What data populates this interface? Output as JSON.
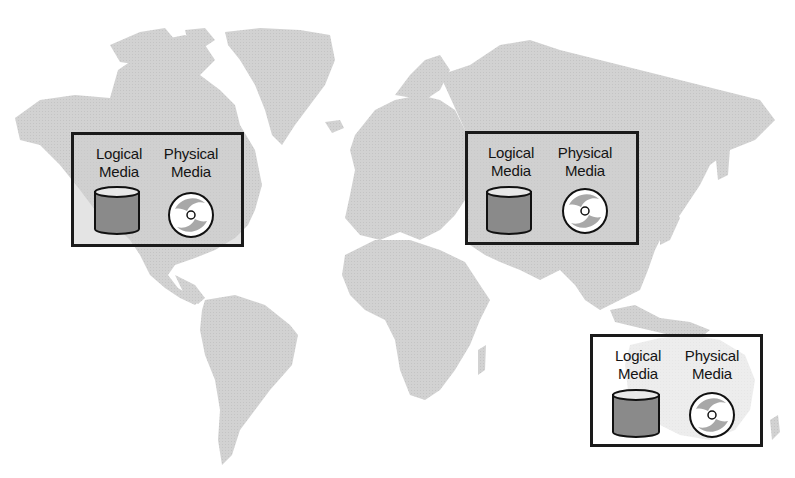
{
  "diagram": {
    "background": "world-map",
    "colors": {
      "land": "#cfcfcf",
      "ocean": "#ffffff",
      "box_border": "#1a1a1a",
      "cylinder_fill": "#8a8a8a",
      "disc_fill": "#ffffff",
      "disc_swirl": "#a8a8a8"
    },
    "sites": [
      {
        "region": "North America",
        "logical": {
          "line1": "Logical",
          "line2": "Media",
          "icon": "cylinder-icon"
        },
        "physical": {
          "line1": "Physical",
          "line2": "Media",
          "icon": "disc-icon"
        }
      },
      {
        "region": "Asia",
        "logical": {
          "line1": "Logical",
          "line2": "Media",
          "icon": "cylinder-icon"
        },
        "physical": {
          "line1": "Physical",
          "line2": "Media",
          "icon": "disc-icon"
        }
      },
      {
        "region": "Australia",
        "logical": {
          "line1": "Logical",
          "line2": "Media",
          "icon": "cylinder-icon"
        },
        "physical": {
          "line1": "Physical",
          "line2": "Media",
          "icon": "disc-icon"
        }
      }
    ]
  }
}
